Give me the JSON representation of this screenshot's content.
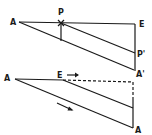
{
  "diagram": {
    "top_figure": {
      "labels": {
        "A": "A",
        "P": "P",
        "E": "E",
        "P_prime": "P'",
        "A_prime": "A'"
      }
    },
    "bottom_figure": {
      "labels": {
        "A_left": "A",
        "E": "E",
        "A_right": "A"
      },
      "arrows": [
        "motion-arrow-right-of-E",
        "motion-arrow-along-diagonal"
      ]
    },
    "colors": {
      "ink": "#1a1a1a",
      "background": "#ffffff"
    }
  }
}
